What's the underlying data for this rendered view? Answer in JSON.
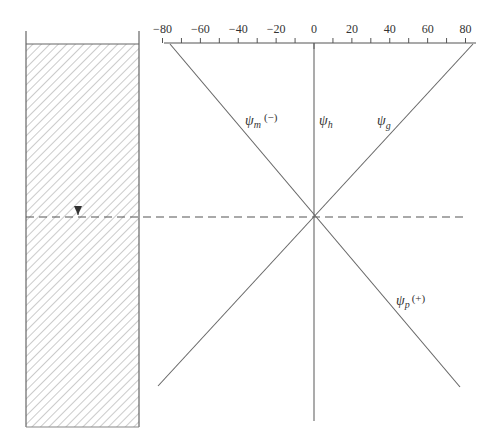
{
  "figure": {
    "type": "soil-water potential diagram",
    "axis": {
      "ticks": [
        -80,
        -60,
        -40,
        -20,
        0,
        20,
        40,
        60,
        80
      ],
      "tick_labels": [
        "−80",
        "−60",
        "−40",
        "−20",
        "0",
        "20",
        "40",
        "60",
        "80"
      ],
      "minor_step": 10,
      "range": [
        -80,
        80
      ]
    },
    "soil_column": {
      "pattern": "diagonal-hatch",
      "water_table_marker": "▼"
    },
    "water_table": {
      "style": "dashed"
    },
    "lines": [
      {
        "id": "psi_m",
        "symbol": "ψ",
        "subscript": "m",
        "sign": "(−)"
      },
      {
        "id": "psi_h",
        "symbol": "ψ",
        "subscript": "h",
        "sign": ""
      },
      {
        "id": "psi_g",
        "symbol": "ψ",
        "subscript": "g",
        "sign": ""
      },
      {
        "id": "psi_p",
        "symbol": "ψ",
        "subscript": "p",
        "sign": "(+)"
      }
    ],
    "colors": {
      "line": "#555555",
      "hatch": "#9a9a9a",
      "text": "#333333"
    }
  }
}
